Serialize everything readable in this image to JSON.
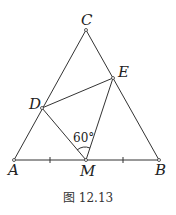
{
  "figure": {
    "caption": "图 12.13",
    "points": {
      "A": {
        "label": "A",
        "x": 14,
        "y": 160
      },
      "B": {
        "label": "B",
        "x": 159,
        "y": 160
      },
      "C": {
        "label": "C",
        "x": 86,
        "y": 30
      },
      "D": {
        "label": "D",
        "x": 42,
        "y": 108
      },
      "E": {
        "label": "E",
        "x": 113,
        "y": 78
      },
      "M": {
        "label": "M",
        "x": 86,
        "y": 160
      }
    },
    "segments": [
      "AB",
      "BC",
      "CA",
      "DE",
      "DM",
      "EM"
    ],
    "angle_label": "60°",
    "tick_marks": [
      "AM",
      "MB"
    ],
    "colors": {
      "stroke": "#333333",
      "text": "#222222"
    }
  }
}
